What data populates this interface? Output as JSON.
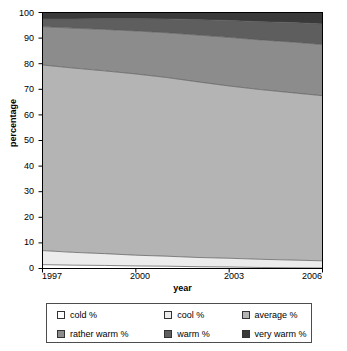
{
  "chart_data": {
    "type": "area",
    "title": "",
    "subtitle": "",
    "xlabel": "year",
    "ylabel": "percentage",
    "x": [
      1997,
      1998,
      1999,
      2000,
      2001,
      2002,
      2003,
      2004,
      2005,
      2006
    ],
    "xticks": [
      "1997",
      "2000",
      "2003",
      "2006"
    ],
    "xtick_values": [
      1997,
      2000,
      2003,
      2006
    ],
    "xlim": [
      1997,
      2006
    ],
    "yticks": [
      "0",
      "10",
      "20",
      "30",
      "40",
      "50",
      "60",
      "70",
      "80",
      "90",
      "100"
    ],
    "ytick_values": [
      0,
      10,
      20,
      30,
      40,
      50,
      60,
      70,
      80,
      90,
      100
    ],
    "ylim": [
      0,
      100
    ],
    "grid": false,
    "stacked": true,
    "legend_position": "bottom",
    "series": [
      {
        "name": "cold %",
        "color": "#ffffff",
        "values": [
          1.5,
          1.3,
          1.2,
          1.0,
          0.9,
          0.7,
          0.6,
          0.4,
          0.3,
          0.2
        ]
      },
      {
        "name": "cool %",
        "color": "#ececec",
        "values": [
          5.5,
          5.0,
          4.6,
          4.2,
          3.9,
          3.6,
          3.4,
          3.2,
          3.0,
          2.8
        ]
      },
      {
        "name": "average %",
        "color": "#b4b4b4",
        "values": [
          72.5,
          72.0,
          71.4,
          70.8,
          69.8,
          68.6,
          67.3,
          66.3,
          65.4,
          64.5
        ]
      },
      {
        "name": "rather warm %",
        "color": "#8c8c8c",
        "values": [
          15.0,
          15.6,
          16.2,
          16.8,
          17.5,
          18.3,
          19.0,
          19.4,
          19.8,
          20.0
        ]
      },
      {
        "name": "warm %",
        "color": "#5e5e5e",
        "values": [
          3.0,
          3.6,
          4.2,
          4.8,
          5.4,
          6.0,
          6.6,
          7.1,
          7.6,
          8.0
        ]
      },
      {
        "name": "very warm %",
        "color": "#3a3a3a",
        "values": [
          2.5,
          2.5,
          2.4,
          2.4,
          2.5,
          2.8,
          3.1,
          3.6,
          3.9,
          4.5
        ]
      }
    ],
    "cumulative_top_boundaries": [
      {
        "name": "cold %",
        "values": [
          1.5,
          1.3,
          1.2,
          1.0,
          0.9,
          0.7,
          0.6,
          0.4,
          0.3,
          0.2
        ]
      },
      {
        "name": "cool %",
        "values": [
          7.0,
          6.3,
          5.8,
          5.2,
          4.8,
          4.3,
          4.0,
          3.6,
          3.3,
          3.0
        ]
      },
      {
        "name": "average %",
        "values": [
          79.5,
          78.3,
          77.2,
          76.0,
          74.6,
          72.9,
          71.3,
          69.9,
          68.7,
          67.5
        ]
      },
      {
        "name": "rather warm %",
        "values": [
          94.5,
          93.9,
          93.4,
          92.8,
          92.1,
          91.2,
          90.3,
          89.3,
          88.5,
          87.5
        ]
      },
      {
        "name": "warm %",
        "values": [
          97.5,
          97.5,
          97.6,
          97.6,
          97.5,
          97.2,
          96.9,
          96.4,
          96.1,
          95.5
        ]
      },
      {
        "name": "very warm %",
        "values": [
          100,
          100,
          100,
          100,
          100,
          100,
          100,
          100,
          100,
          100
        ]
      }
    ]
  },
  "legend": {
    "rows": [
      [
        {
          "label": "cold %",
          "color": "#ffffff"
        },
        {
          "label": "cool %",
          "color": "#ececec"
        },
        {
          "label": "average %",
          "color": "#b4b4b4"
        }
      ],
      [
        {
          "label": "rather warm %",
          "color": "#8c8c8c"
        },
        {
          "label": "warm %",
          "color": "#5e5e5e"
        },
        {
          "label": "very warm %",
          "color": "#3a3a3a"
        }
      ]
    ]
  },
  "axes": {
    "y_title": "percentage",
    "x_title": "year",
    "y_tick_labels": [
      "100",
      "90",
      "80",
      "70",
      "60",
      "50",
      "40",
      "30",
      "20",
      "10",
      "0"
    ],
    "x_tick_labels": [
      "1997",
      "2000",
      "2003",
      "2006"
    ]
  },
  "style": {
    "axis_color": "#000000",
    "plot_border_color": "#000000",
    "legend_border_color": "#4d4d4d",
    "background": "#ffffff"
  }
}
